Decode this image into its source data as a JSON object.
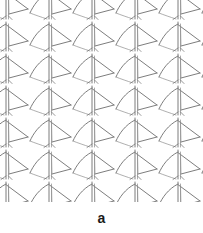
{
  "figure": {
    "panel_label": "a",
    "caption_label": "a",
    "background_color": "#ffffff",
    "line_color": "#6e6e6e",
    "line_color_light": "#909090",
    "line_width": 0.9
  },
  "pattern": {
    "description": "repeating arrow / sail motif wallpaper pattern",
    "motif_name": "arrow-sail-motif",
    "tile_width": 43,
    "tile_height": 32,
    "columns": 5,
    "rows": 7,
    "origin_x": -14,
    "origin_y": -12,
    "region": {
      "x": 0,
      "y": 0,
      "width": 203,
      "height": 202
    }
  },
  "motif_geometry": {
    "mast": {
      "x1": 20,
      "y1": 2,
      "x2": 20,
      "y2": 31
    },
    "mast_second": {
      "x1": 22.5,
      "y1": 4,
      "x2": 22.5,
      "y2": 31
    },
    "hook_curve": {
      "start_x": 20,
      "start_y": 4,
      "c1x": 10,
      "c1y": 9,
      "c2x": 4,
      "c2y": 18,
      "end_x": 1,
      "end_y": 25
    },
    "flag_upper": {
      "x1": 20.5,
      "y1": 5,
      "x2": 42,
      "y2": 21
    },
    "flag_lower": {
      "x1": 42,
      "y1": 21,
      "x2": 23,
      "y2": 26
    },
    "flag_close": {
      "x1": 23,
      "y1": 26,
      "x2": 22.5,
      "y2": 6
    },
    "barb_left": {
      "x1": 20,
      "y1": 28,
      "x2": 15,
      "y2": 31.5
    },
    "barb_right": {
      "x1": 22.5,
      "y1": 28,
      "x2": 26,
      "y2": 31.5
    },
    "tail_curve": {
      "start_x": 1,
      "start_y": 25,
      "c1x": 6,
      "c1y": 27,
      "c2x": 12,
      "c2y": 29,
      "end_x": 18,
      "end_y": 31
    }
  }
}
